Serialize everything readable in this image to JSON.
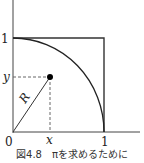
{
  "figure": {
    "caption": "図4.8　πを求めるために",
    "labels": {
      "y_tick_one": "1",
      "y_point": "y",
      "origin": "0",
      "x_point": "x",
      "x_tick_one": "1",
      "radius": "R"
    },
    "elements": [
      "y-axis",
      "x-axis",
      "unit-square",
      "quarter-circle-arc",
      "point",
      "radius-line",
      "dashed-guides"
    ],
    "colors": {
      "stroke": "#333333",
      "point": "#000000",
      "dashed": "#666666"
    }
  }
}
